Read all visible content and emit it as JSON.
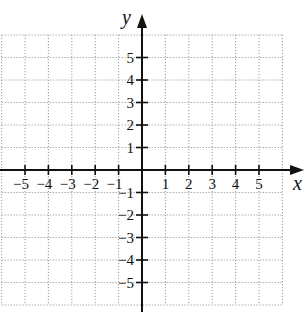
{
  "chart_data": {
    "type": "coordinate-plane",
    "title": "",
    "xlabel": "x",
    "ylabel": "y",
    "xlim": [
      -6,
      6
    ],
    "ylim": [
      -6,
      6
    ],
    "grid": true,
    "grid_style": "dotted",
    "x_ticks": [
      -5,
      -4,
      -3,
      -2,
      -1,
      1,
      2,
      3,
      4,
      5
    ],
    "y_ticks": [
      -5,
      -4,
      -3,
      -2,
      -1,
      1,
      2,
      3,
      4,
      5
    ],
    "x_tick_labels": [
      "−5",
      "−4",
      "−3",
      "−2",
      "−1",
      "1",
      "2",
      "3",
      "4",
      "5"
    ],
    "y_tick_labels": [
      "−5",
      "−4",
      "−3",
      "−2",
      "−1",
      "1",
      "2",
      "3",
      "4",
      "5"
    ],
    "series": []
  },
  "labels": {
    "x_axis": "x",
    "y_axis": "y"
  },
  "colors": {
    "axis": "#111111",
    "grid": "#9a9a9a",
    "text": "#111111"
  }
}
